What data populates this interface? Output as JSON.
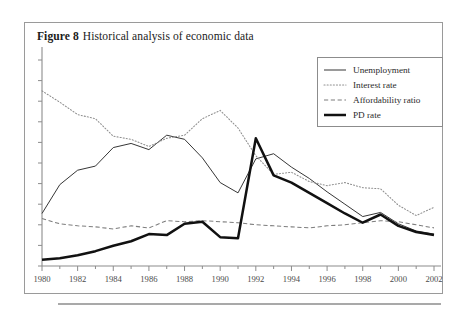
{
  "figure": {
    "label": "Figure 8",
    "title": "Historical analysis of economic data"
  },
  "legend": {
    "position": "top-right",
    "entries": [
      {
        "name": "Unemployment",
        "style": "solid-thin",
        "color": "#2b2b2b"
      },
      {
        "name": "Interest rate",
        "style": "dotted",
        "color": "#8f8f8f"
      },
      {
        "name": "Affordability ratio",
        "style": "dashed",
        "color": "#7d7d7d"
      },
      {
        "name": "PD rate",
        "style": "solid-thick",
        "color": "#111111"
      }
    ]
  },
  "chart_data": {
    "type": "line",
    "title": "Historical analysis of economic data",
    "xlabel": "",
    "ylabel": "",
    "grid": false,
    "legend_position": "top-right",
    "xlim": [
      1980,
      2002
    ],
    "ylim": [
      0,
      10
    ],
    "x": [
      1980,
      1981,
      1982,
      1983,
      1984,
      1985,
      1986,
      1987,
      1988,
      1989,
      1990,
      1991,
      1992,
      1993,
      1994,
      1995,
      1996,
      1997,
      1998,
      1999,
      2000,
      2001,
      2002
    ],
    "xticks": [
      1980,
      1982,
      1984,
      1986,
      1988,
      1990,
      1992,
      1994,
      1996,
      1998,
      2000,
      2002
    ],
    "xticklabels": [
      "1980",
      "1982",
      "1984",
      "1986",
      "1988",
      "1990",
      "1992",
      "1994",
      "1996",
      "1998",
      "2000",
      "2002"
    ],
    "yticks": [
      0,
      1,
      2,
      3,
      4,
      5,
      6,
      7,
      8,
      9,
      10
    ],
    "yticklabels": [],
    "series": [
      {
        "name": "Unemployment",
        "style": "solid-thin",
        "color": "#2b2b2b",
        "values": [
          2.55,
          3.95,
          4.65,
          4.85,
          5.75,
          5.95,
          5.65,
          6.35,
          6.15,
          5.25,
          4.05,
          3.55,
          5.2,
          5.45,
          4.8,
          4.25,
          3.6,
          3.0,
          2.4,
          2.6,
          2.05,
          1.7,
          1.55
        ]
      },
      {
        "name": "Interest rate",
        "style": "dotted",
        "color": "#8f8f8f",
        "values": [
          8.5,
          7.95,
          7.35,
          7.15,
          6.3,
          6.15,
          5.8,
          6.2,
          6.35,
          7.15,
          7.55,
          6.7,
          5.35,
          4.45,
          4.55,
          4.1,
          3.9,
          4.05,
          3.8,
          3.75,
          2.95,
          2.45,
          2.85
        ]
      },
      {
        "name": "Affordability ratio",
        "style": "dashed",
        "color": "#7d7d7d",
        "values": [
          2.3,
          2.05,
          1.95,
          1.9,
          1.8,
          1.95,
          1.85,
          2.2,
          2.15,
          2.2,
          2.15,
          2.1,
          2.0,
          1.95,
          1.9,
          1.85,
          1.95,
          2.0,
          2.1,
          2.2,
          2.15,
          2.0,
          1.85
        ]
      },
      {
        "name": "PD rate",
        "style": "solid-thick",
        "color": "#111111",
        "values": [
          0.3,
          0.38,
          0.52,
          0.72,
          0.98,
          1.2,
          1.55,
          1.5,
          2.05,
          2.15,
          1.4,
          1.35,
          6.2,
          4.4,
          4.05,
          3.55,
          3.05,
          2.55,
          2.1,
          2.5,
          1.95,
          1.65,
          1.5
        ]
      }
    ]
  }
}
